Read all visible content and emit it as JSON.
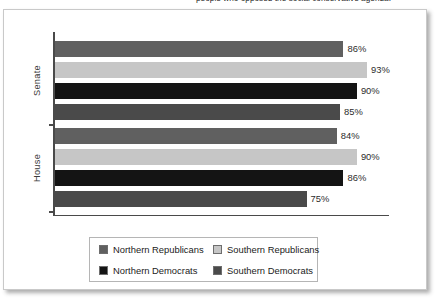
{
  "caption": {
    "text": "people who opposed the social conservative agenda."
  },
  "chart_data": {
    "type": "bar",
    "orientation": "horizontal",
    "title": "",
    "xlabel": "",
    "ylabel": "",
    "xlim": [
      0,
      100
    ],
    "grid": false,
    "legend_position": "bottom",
    "categories": [
      "Senate",
      "House"
    ],
    "series": [
      {
        "name": "Northern Republicans",
        "color": "#606060",
        "values": [
          86,
          84
        ]
      },
      {
        "name": "Southern Republicans",
        "color": "#c6c6c6",
        "values": [
          93,
          90
        ]
      },
      {
        "name": "Northern Democrats",
        "color": "#141414",
        "values": [
          90,
          86
        ]
      },
      {
        "name": "Southern Democrats",
        "color": "#4a4a4a",
        "values": [
          85,
          75
        ]
      }
    ],
    "bars": [
      {
        "group": "Senate",
        "series": "Northern Republicans",
        "value": 86,
        "label": "86%",
        "color": "#606060"
      },
      {
        "group": "Senate",
        "series": "Southern Republicans",
        "value": 93,
        "label": "93%",
        "color": "#c6c6c6"
      },
      {
        "group": "Senate",
        "series": "Northern Democrats",
        "value": 90,
        "label": "90%",
        "color": "#141414"
      },
      {
        "group": "Senate",
        "series": "Southern Democrats",
        "value": 85,
        "label": "85%",
        "color": "#4a4a4a"
      },
      {
        "group": "House",
        "series": "Northern Republicans",
        "value": 84,
        "label": "84%",
        "color": "#606060"
      },
      {
        "group": "House",
        "series": "Southern Republicans",
        "value": 90,
        "label": "90%",
        "color": "#c6c6c6"
      },
      {
        "group": "House",
        "series": "Northern Democrats",
        "value": 86,
        "label": "86%",
        "color": "#141414"
      },
      {
        "group": "House",
        "series": "Southern Democrats",
        "value": 75,
        "label": "75%",
        "color": "#4a4a4a"
      }
    ]
  },
  "axis": {
    "groups": [
      {
        "label": "Senate"
      },
      {
        "label": "House"
      }
    ]
  },
  "legend": {
    "items": [
      {
        "label": "Northern Republicans",
        "color": "#606060"
      },
      {
        "label": "Southern Republicans",
        "color": "#c6c6c6"
      },
      {
        "label": "Northern Democrats",
        "color": "#141414"
      },
      {
        "label": "Southern Democrats",
        "color": "#4a4a4a"
      }
    ]
  }
}
